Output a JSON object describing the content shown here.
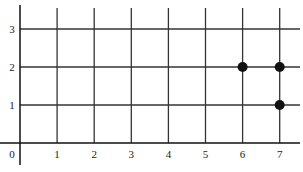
{
  "chart_data": {
    "type": "scatter",
    "title": "",
    "xlabel": "",
    "ylabel": "",
    "x_ticks": [
      "0",
      "1",
      "2",
      "3",
      "4",
      "5",
      "6",
      "7"
    ],
    "y_ticks": [
      "1",
      "2",
      "3"
    ],
    "xlim": [
      0,
      7.4
    ],
    "ylim": [
      0,
      3.3
    ],
    "grid": true,
    "legend": null,
    "series": [
      {
        "name": "points",
        "points": [
          {
            "x": 6,
            "y": 2
          },
          {
            "x": 7,
            "y": 2
          },
          {
            "x": 7,
            "y": 1
          }
        ]
      }
    ]
  },
  "colors": {
    "grid": "#333333",
    "point": "#111111",
    "background": "#ffffff"
  }
}
